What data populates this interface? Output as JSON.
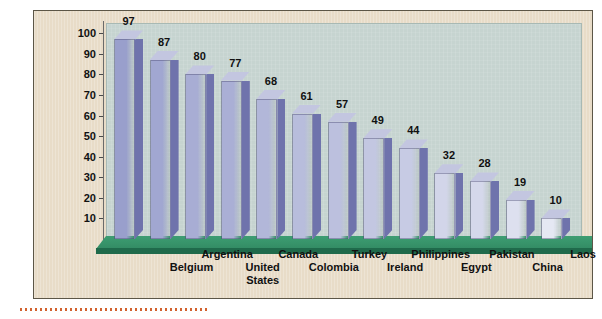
{
  "chart_data": {
    "type": "bar",
    "title": "",
    "xlabel": "",
    "ylabel": "Per Cent of Population Living in Urban Areas",
    "ylim": [
      0,
      105
    ],
    "grid": false,
    "legend": "none",
    "categories": [
      "Belgium",
      "Argentina",
      "United States",
      "Canada",
      "Colombia",
      "Turkey",
      "Ireland",
      "Philippines",
      "Egypt",
      "Pakistan",
      "China",
      "Laos",
      "Nepal"
    ],
    "values": [
      97,
      87,
      80,
      77,
      68,
      61,
      57,
      49,
      44,
      32,
      28,
      19,
      10
    ],
    "ytick_labels": [
      "100",
      "90",
      "80",
      "70",
      "60",
      "50",
      "40",
      "30",
      "20",
      "10"
    ],
    "ytick_values": [
      100,
      90,
      80,
      70,
      60,
      50,
      40,
      30,
      20,
      10
    ],
    "data_labels": [
      "97",
      "87",
      "80",
      "77",
      "68",
      "61",
      "57",
      "49",
      "44",
      "32",
      "28",
      "19",
      "10"
    ],
    "label_rows": [
      1,
      0,
      1,
      0,
      1,
      0,
      1,
      0,
      1,
      0,
      1,
      0,
      1
    ]
  },
  "colors": {
    "page_background": "#ffffff",
    "panel_background": "#e8dcc8",
    "panel_border": "#5c5647",
    "plot_background": "#c6d4d0",
    "floor_green": "#2f8a62",
    "floor_front": "#1f6a4b",
    "bar_front_tall": "#9a9ccb",
    "bar_front_short": "#eef0f7",
    "bar_side": "#6f73ac",
    "bar_top": "#c3c6e0",
    "text": "#111111",
    "accent_dotted_rule": "#d2622e"
  }
}
